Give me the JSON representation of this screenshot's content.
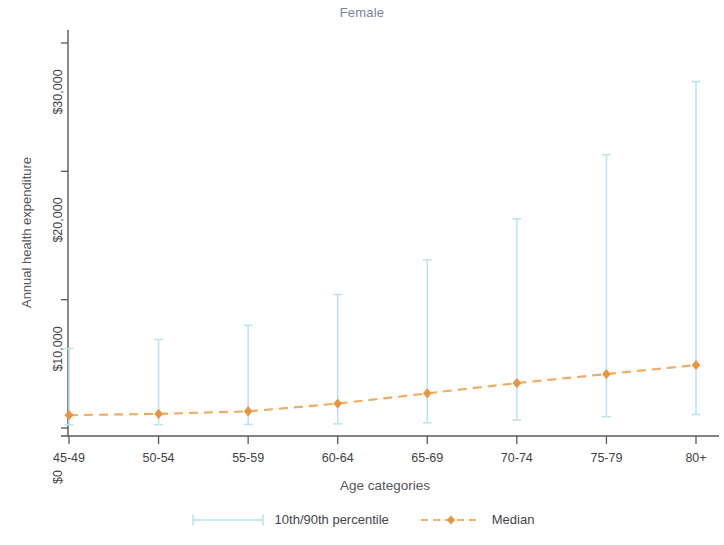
{
  "chart_data": {
    "type": "line",
    "title": "Female",
    "xlabel": "Age categories",
    "ylabel": "Annual health expenditure",
    "categories": [
      "45-49",
      "50-54",
      "55-59",
      "60-64",
      "65-69",
      "70-74",
      "75-79",
      "80+"
    ],
    "ylim": [
      0,
      30000
    ],
    "yticks": [
      0,
      10000,
      20000,
      30000
    ],
    "ytick_labels": [
      "$0",
      "$10,000",
      "$20,000",
      "$30,000"
    ],
    "grid": false,
    "legend_position": "bottom",
    "series": [
      {
        "name": "10th/90th percentile",
        "type": "errorbar",
        "color": "#b7e3f2",
        "p10": [
          250,
          260,
          280,
          320,
          400,
          620,
          880,
          1050
        ],
        "p90": [
          6200,
          6900,
          8000,
          10400,
          13100,
          16300,
          21300,
          27000
        ]
      },
      {
        "name": "Median",
        "type": "line",
        "color": "#eb9440",
        "marker": "diamond",
        "linestyle": "dashed",
        "values": [
          1000,
          1100,
          1300,
          1900,
          2700,
          3500,
          4200,
          4900
        ]
      }
    ]
  },
  "legend": {
    "items": [
      {
        "label": "10th/90th percentile",
        "color": "#b7e3f2",
        "style": "capped-line"
      },
      {
        "label": "Median",
        "color": "#eb9440",
        "style": "dashed-marker"
      }
    ]
  },
  "axis": {
    "title": "Female",
    "ylabel": "Annual health expenditure",
    "xlabel": "Age categories"
  }
}
